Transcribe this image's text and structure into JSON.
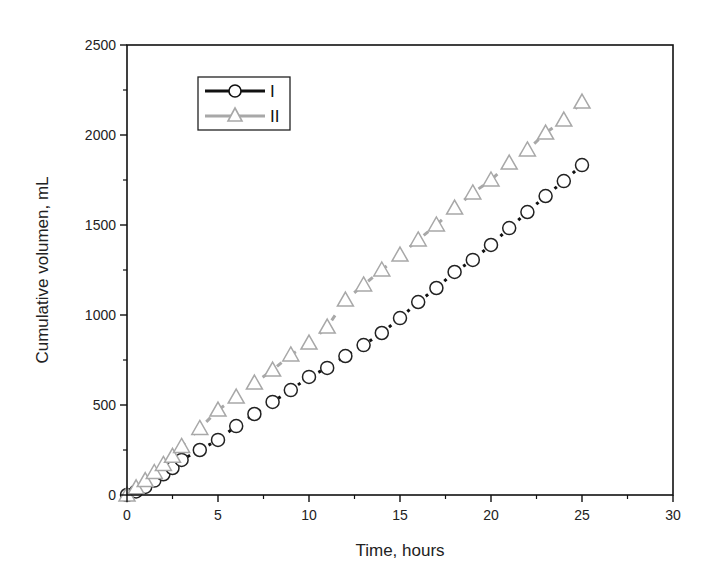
{
  "chart_data": {
    "type": "line",
    "title": "",
    "xlabel": "Time, hours",
    "ylabel": "Cumulative volumen, mL",
    "xlim": [
      0,
      30
    ],
    "ylim": [
      0,
      2500
    ],
    "xticks": [
      0,
      5,
      10,
      15,
      20,
      25,
      30
    ],
    "yticks": [
      0,
      500,
      1000,
      1500,
      2000,
      2500
    ],
    "grid": false,
    "legend_position": "upper-left",
    "series": [
      {
        "name": "I",
        "marker": "circle",
        "color": "#111111",
        "line_style": "dotted",
        "x": [
          0,
          0.5,
          1,
          1.5,
          2,
          2.5,
          3,
          4,
          5,
          6,
          7,
          8,
          9,
          10,
          11,
          12,
          13,
          14,
          15,
          16,
          17,
          18,
          19,
          20,
          21,
          22,
          23,
          24,
          25
        ],
        "values": [
          0,
          20,
          45,
          80,
          115,
          150,
          195,
          250,
          306,
          383,
          450,
          517,
          583,
          656,
          706,
          772,
          833,
          900,
          983,
          1072,
          1150,
          1239,
          1306,
          1389,
          1483,
          1572,
          1661,
          1744,
          1833
        ]
      },
      {
        "name": "II",
        "marker": "triangle",
        "color": "#a8a8a8",
        "line_style": "dashed",
        "x": [
          0,
          0.5,
          1,
          1.5,
          2,
          2.5,
          3,
          4,
          5,
          6,
          7,
          8,
          9,
          10,
          11,
          12,
          13,
          14,
          15,
          16,
          17,
          18,
          19,
          20,
          21,
          22,
          23,
          24,
          25
        ],
        "values": [
          0,
          40,
          80,
          125,
          170,
          215,
          270,
          370,
          472,
          544,
          622,
          694,
          778,
          844,
          933,
          1083,
          1167,
          1250,
          1333,
          1417,
          1500,
          1594,
          1678,
          1750,
          1844,
          1917,
          2011,
          2083,
          2183
        ]
      }
    ]
  }
}
